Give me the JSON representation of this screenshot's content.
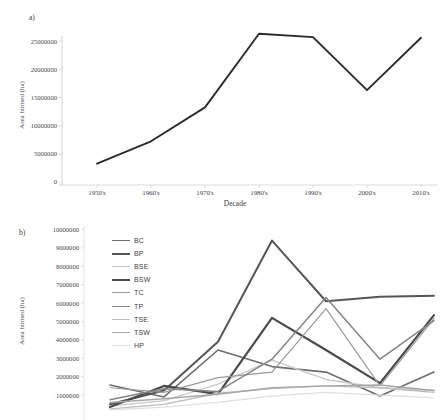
{
  "figure": {
    "panel_a_label": "a)",
    "panel_b_label": "b)"
  },
  "chart_data": [
    {
      "panel": "a)",
      "type": "line",
      "title": "",
      "xlabel": "Decade",
      "ylabel": "Area burned (ha)",
      "categories": [
        "1950's",
        "1960's",
        "1970's",
        "1980's",
        "1990's",
        "2000's",
        "2010's"
      ],
      "series": [
        {
          "name": "Total",
          "color": "#2b2b2b",
          "values": [
            3700000,
            7600000,
            13500000,
            26300000,
            25700000,
            16500000,
            25600000
          ]
        }
      ],
      "ylim": [
        0,
        27500000
      ],
      "yticks": [
        0,
        5000000,
        10000000,
        15000000,
        20000000,
        25000000
      ],
      "ytick_labels": [
        "0",
        "5000000",
        "10000000",
        "15000000",
        "20000000",
        "25000000"
      ],
      "grid": false,
      "legend": "none"
    },
    {
      "panel": "b)",
      "type": "line",
      "title": "",
      "xlabel": "",
      "ylabel": "Area burned (ha)",
      "categories": [
        "1950's",
        "1960's",
        "1970's",
        "1980's",
        "1990's",
        "2000's",
        "2010's"
      ],
      "ylim": [
        0,
        10000000
      ],
      "yticks": [
        1000000,
        2000000,
        3000000,
        4000000,
        5000000,
        6000000,
        7000000,
        8000000,
        9000000,
        10000000
      ],
      "ytick_labels": [
        "1000000",
        "2000000",
        "3000000",
        "4000000",
        "5000000",
        "6000000",
        "7000000",
        "8000000",
        "9000000",
        "10000000"
      ],
      "grid": true,
      "legend": "inside-top-left",
      "note": "x axis labels fall below the visible crop of the screenshot",
      "series": [
        {
          "name": "BC",
          "color": "#6e6e6e",
          "values": [
            1550000,
            900000,
            3450000,
            2550000,
            2250000,
            950000,
            2250000
          ]
        },
        {
          "name": "BP",
          "color": "#565656",
          "values": [
            500000,
            1250000,
            3900000,
            9400000,
            6100000,
            6350000,
            6400000
          ]
        },
        {
          "name": "BSE",
          "color": "#c9c9c9",
          "values": [
            400000,
            700000,
            1600000,
            2900000,
            1850000,
            1400000,
            1250000
          ]
        },
        {
          "name": "BSW",
          "color": "#4a4a4a",
          "values": [
            350000,
            1500000,
            1050000,
            5200000,
            3450000,
            1650000,
            5350000
          ]
        },
        {
          "name": "TC",
          "color": "#9a9a9a",
          "values": [
            1400000,
            1150000,
            1950000,
            2250000,
            5700000,
            1500000,
            5150000
          ]
        },
        {
          "name": "TP",
          "color": "#858585",
          "values": [
            750000,
            1350000,
            1200000,
            2950000,
            6300000,
            2950000,
            5050000
          ]
        },
        {
          "name": "TSE",
          "color": "#bdbdbd",
          "values": [
            250000,
            500000,
            1100000,
            1350000,
            1500000,
            1400000,
            1150000
          ]
        },
        {
          "name": "TSW",
          "color": "#a8a8a8",
          "values": [
            600000,
            800000,
            1050000,
            1400000,
            1500000,
            1550000,
            1250000
          ]
        },
        {
          "name": "HP",
          "color": "#e0e0e0",
          "values": [
            200000,
            350000,
            600000,
            950000,
            1150000,
            1000000,
            850000
          ]
        }
      ]
    }
  ],
  "panel_a": {
    "label": "a)",
    "y_axis_title": "Area burned (ha)",
    "x_axis_title": "Decade",
    "y_ticks": [
      "25000000",
      "20000000",
      "15000000",
      "10000000",
      "5000000",
      "0"
    ],
    "x_ticks": [
      "1950's",
      "1960's",
      "1970's",
      "1980's",
      "1990's",
      "2000's",
      "2010's"
    ]
  },
  "panel_b": {
    "label": "b)",
    "y_axis_title": "Area burned (ha)",
    "y_ticks": [
      "10000000",
      "9000000",
      "8000000",
      "7000000",
      "6000000",
      "5000000",
      "4000000",
      "3000000",
      "2000000",
      "1000000"
    ],
    "legend": [
      {
        "label": "BC",
        "color": "#6e6e6e",
        "width": 1.6
      },
      {
        "label": "BP",
        "color": "#565656",
        "width": 2.0
      },
      {
        "label": "BSE",
        "color": "#c9c9c9",
        "width": 1.4
      },
      {
        "label": "BSW",
        "color": "#4a4a4a",
        "width": 2.2
      },
      {
        "label": "TC",
        "color": "#9a9a9a",
        "width": 1.2
      },
      {
        "label": "TP",
        "color": "#858585",
        "width": 1.5
      },
      {
        "label": "TSE",
        "color": "#bdbdbd",
        "width": 1.3
      },
      {
        "label": "TSW",
        "color": "#a8a8a8",
        "width": 1.4
      },
      {
        "label": "HP",
        "color": "#e0e0e0",
        "width": 1.3
      }
    ]
  }
}
